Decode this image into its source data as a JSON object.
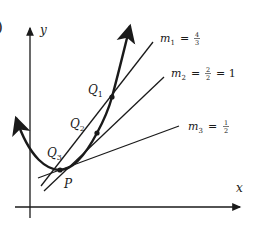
{
  "figure": {
    "partial_label": ")",
    "axes": {
      "x_label": "x",
      "y_label": "y"
    },
    "points": [
      {
        "id": "P",
        "label": "P"
      },
      {
        "id": "Q1",
        "label": "Q",
        "sub": "1"
      },
      {
        "id": "Q2",
        "label": "Q",
        "sub": "2"
      },
      {
        "id": "Q3",
        "label": "Q",
        "sub": "3"
      }
    ],
    "secant_lines": [
      {
        "id": "m1",
        "name": "m",
        "sub": "1",
        "eq": "=",
        "num": "4",
        "den": "3",
        "extra": ""
      },
      {
        "id": "m2",
        "name": "m",
        "sub": "2",
        "eq": "=",
        "num": "2",
        "den": "2",
        "extra": "= 1"
      },
      {
        "id": "m3",
        "name": "m",
        "sub": "3",
        "eq": "=",
        "num": "1",
        "den": "2",
        "extra": ""
      }
    ],
    "colors": {
      "ink": "#1a1a1a",
      "background": "#ffffff"
    }
  }
}
